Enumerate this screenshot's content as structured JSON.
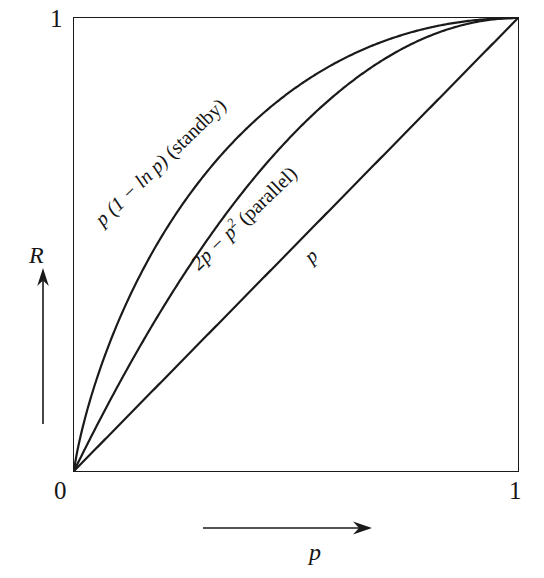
{
  "figure": {
    "ticks": {
      "y_top": "1",
      "origin": "0",
      "x_right": "1"
    },
    "axis_titles": {
      "y": "R",
      "x": "p"
    },
    "icons": {
      "y_arrow": "arrow-up-icon",
      "x_arrow": "arrow-right-icon"
    },
    "annotations": {
      "standby": {
        "expression_lead": "p",
        "expression_body": "(1 − ln p)",
        "system": "(standby)",
        "full": "p (1 − ln p) (standby)"
      },
      "parallel": {
        "expression_lead": "2p − p",
        "exponent": "2",
        "system": "(parallel)",
        "full": "2p − p² (parallel)"
      },
      "simple": {
        "expression_lead": "p",
        "full": "p"
      }
    },
    "colors": {
      "ink": "#1a1a1a",
      "background": "#ffffff"
    }
  },
  "chart_data": {
    "type": "line",
    "title": "",
    "subtitle": "",
    "xlabel": "p",
    "ylabel": "R",
    "xlim": [
      0,
      1
    ],
    "ylim": [
      0,
      1
    ],
    "xticks": [
      0,
      1
    ],
    "xticklabels": [
      "0",
      "1"
    ],
    "yticks": [
      0,
      1
    ],
    "yticklabels": [
      "0",
      "1"
    ],
    "grid": false,
    "legend": "inline-curve-labels",
    "x": [
      0.0,
      0.02,
      0.05,
      0.1,
      0.15,
      0.2,
      0.25,
      0.3,
      0.35,
      0.4,
      0.45,
      0.5,
      0.55,
      0.6,
      0.65,
      0.7,
      0.75,
      0.8,
      0.85,
      0.9,
      0.95,
      1.0
    ],
    "series": [
      {
        "name": "p (1 − ln p)  (standby)",
        "formula": "p*(1-ln(p))",
        "values": [
          0.0,
          0.098,
          0.2,
          0.33,
          0.434,
          0.522,
          0.597,
          0.661,
          0.717,
          0.767,
          0.809,
          0.847,
          0.879,
          0.906,
          0.93,
          0.95,
          0.966,
          0.979,
          0.988,
          0.995,
          0.999,
          1.0
        ]
      },
      {
        "name": "2p − p²  (parallel)",
        "formula": "2p-p^2",
        "values": [
          0.0,
          0.04,
          0.098,
          0.19,
          0.278,
          0.36,
          0.438,
          0.51,
          0.578,
          0.64,
          0.698,
          0.75,
          0.798,
          0.84,
          0.878,
          0.91,
          0.938,
          0.96,
          0.978,
          0.99,
          0.998,
          1.0
        ]
      },
      {
        "name": "p",
        "formula": "p",
        "values": [
          0.0,
          0.02,
          0.05,
          0.1,
          0.15,
          0.2,
          0.25,
          0.3,
          0.35,
          0.4,
          0.45,
          0.5,
          0.55,
          0.6,
          0.65,
          0.7,
          0.75,
          0.8,
          0.85,
          0.9,
          0.95,
          1.0
        ]
      }
    ]
  }
}
